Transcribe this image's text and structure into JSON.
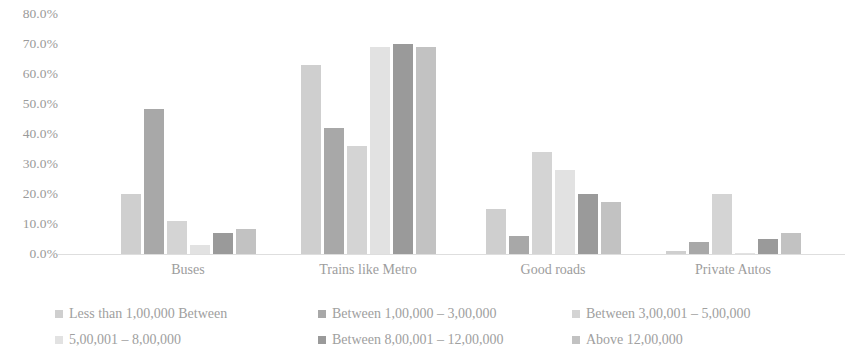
{
  "chart_data": {
    "type": "bar",
    "title": "",
    "subtitle": "",
    "xlabel": "",
    "ylabel": "",
    "ylim": [
      0,
      80
    ],
    "ytick_step": 10,
    "ytick_labels": [
      "80.0%",
      "70.0%",
      "60.0%",
      "50.0%",
      "40.0%",
      "30.0%",
      "20.0%",
      "10.0%",
      "0.0%"
    ],
    "ytick_values": [
      80,
      70,
      60,
      50,
      40,
      30,
      20,
      10,
      0
    ],
    "grid": false,
    "legend_position": "bottom",
    "categories": [
      "Buses",
      "Trains like Metro",
      "Good roads",
      "Private Autos"
    ],
    "series": [
      {
        "name": "Less than 1,00,000 Between",
        "color": "#cfcfcf",
        "values": [
          20.0,
          63.0,
          15.0,
          1.0
        ]
      },
      {
        "name": "Between 1,00,000 – 3,00,000",
        "color": "#a8a8a8",
        "values": [
          48.5,
          42.0,
          6.0,
          4.0
        ]
      },
      {
        "name": "Between 3,00,001 – 5,00,000",
        "color": "#d4d4d4",
        "values": [
          11.0,
          36.0,
          34.0,
          20.0
        ]
      },
      {
        "name": "5,00,001 – 8,00,000",
        "color": "#e2e2e2",
        "values": [
          3.0,
          69.0,
          28.0,
          0.5
        ]
      },
      {
        "name": "Between 8,00,001 – 12,00,000",
        "color": "#9a9a9a",
        "values": [
          7.0,
          70.0,
          20.0,
          5.0
        ]
      },
      {
        "name": "Above 12,00,000",
        "color": "#c2c2c2",
        "values": [
          8.5,
          69.0,
          17.5,
          7.0
        ]
      }
    ]
  }
}
